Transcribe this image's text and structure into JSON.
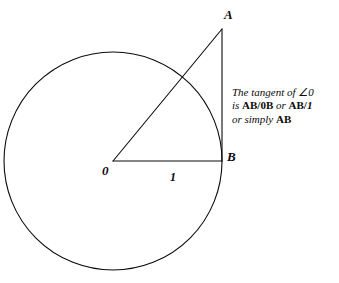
{
  "figure": {
    "background_color": "#ffffff",
    "stroke_color": "#0a0a0a"
  },
  "circle": {
    "name": "unit-circle",
    "center_x": 113,
    "center_y": 161,
    "radius": 109
  },
  "points": [
    {
      "id": "A",
      "label": "A",
      "x": 222,
      "y": 29
    },
    {
      "id": "B",
      "label": "B",
      "x": 222,
      "y": 161
    },
    {
      "id": "O",
      "label": "0",
      "x": 113,
      "y": 161
    }
  ],
  "segments": [
    {
      "id": "hypotenuse",
      "from": "O",
      "to": "A"
    },
    {
      "id": "tangent",
      "from": "A",
      "to": "B"
    },
    {
      "id": "radius",
      "from": "O",
      "to": "B",
      "label": "1"
    }
  ],
  "radius_label": "1",
  "annotation": {
    "line1": "The tangent of ∠0",
    "line2_pre": "is ",
    "line2_term1": "AB/0B",
    "line2_mid": " or ",
    "line2_term2a": "AB/",
    "line2_term2b": "1",
    "line3_pre": "or simply ",
    "line3_term": "AB"
  }
}
